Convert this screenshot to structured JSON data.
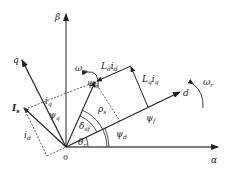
{
  "diagram": {
    "title": "",
    "type": "phasor diagram (PMSM vector diagram in αβ and dq frames)",
    "origin_label": "0",
    "axes": {
      "alpha": {
        "label": "α"
      },
      "beta": {
        "label": "β"
      },
      "d": {
        "label": "d"
      },
      "q": {
        "label": "q"
      }
    },
    "vectors": {
      "psi_s": {
        "label": "ψ",
        "sub": "s"
      },
      "psi_f": {
        "label": "ψ",
        "sub": "f"
      },
      "psi_d": {
        "label": "ψ",
        "sub": "d"
      },
      "psi_q": {
        "label": "ψ",
        "sub": "q"
      },
      "I_s": {
        "label": "I",
        "sub": "s"
      },
      "i_d": {
        "label": "i",
        "sub": "d"
      },
      "i_q": {
        "label": "i",
        "sub": "q"
      },
      "Ld_id": {
        "label": "L",
        "sub1": "d",
        "label2": "i",
        "sub2": "d"
      },
      "Lq_iq": {
        "label": "L",
        "sub1": "q",
        "label2": "i",
        "sub2": "q"
      }
    },
    "angles": {
      "theta_r": {
        "label": "θ",
        "sub": "r"
      },
      "delta_sf": {
        "label": "δ",
        "sub": "sf"
      },
      "rho_s": {
        "label": "ρ",
        "sub": "s"
      }
    },
    "rotations": {
      "omega_psi": {
        "label": "ω",
        "sub": "ψ"
      },
      "omega_r": {
        "label": "ω",
        "sub": "r"
      }
    },
    "colors": {
      "line": "#222222",
      "dashed": "#333333",
      "background": "#ffffff"
    }
  }
}
